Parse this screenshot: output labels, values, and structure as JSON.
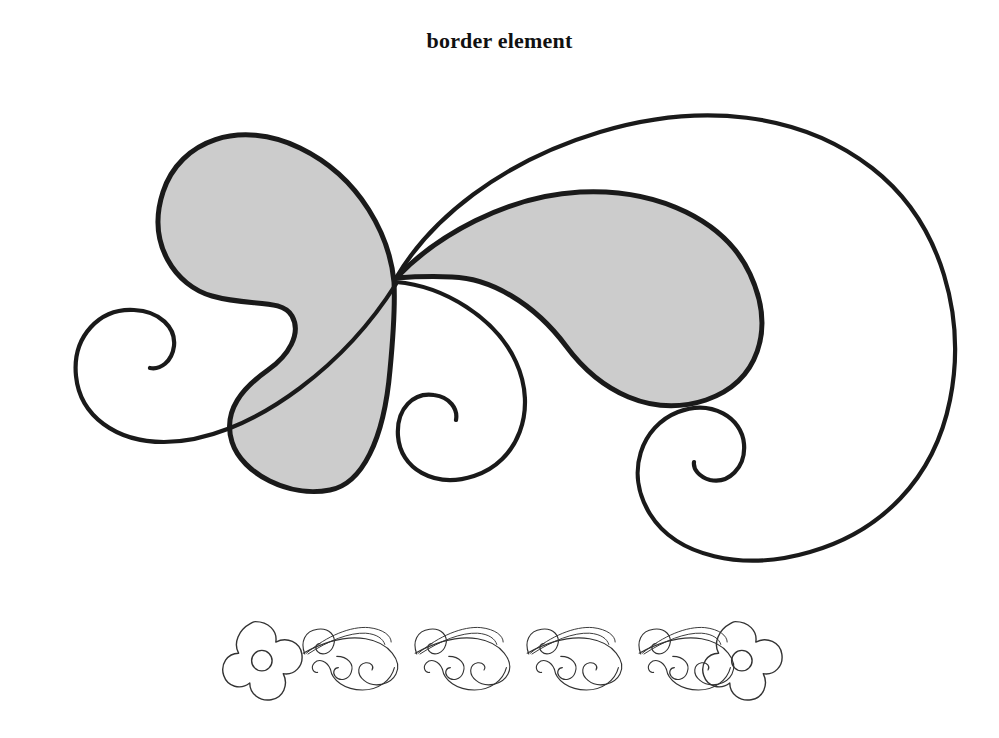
{
  "page": {
    "background_color": "#ffffff",
    "width": 999,
    "height": 738
  },
  "caption": {
    "text": "border element",
    "color": "#111111"
  },
  "artwork": {
    "title": "border element",
    "style": "paisley filigree flourish",
    "stroke_color": "#1a1a1a",
    "fill_color": "#cccccc",
    "thin_stroke_color": "#333333",
    "main_ornament": {
      "name": "paisley-flourish",
      "parts": [
        {
          "name": "left-paisley-leaf",
          "fill": "#cccccc",
          "stroke": "#1a1a1a"
        },
        {
          "name": "right-paisley-leaf",
          "fill": "#cccccc",
          "stroke": "#1a1a1a"
        },
        {
          "name": "outer-sweep-arc",
          "fill": "none",
          "stroke": "#1a1a1a"
        },
        {
          "name": "left-spiral-curl",
          "fill": "none",
          "stroke": "#1a1a1a"
        },
        {
          "name": "center-spiral-curl",
          "fill": "none",
          "stroke": "#1a1a1a"
        },
        {
          "name": "right-spiral-curl",
          "fill": "none",
          "stroke": "#1a1a1a"
        }
      ]
    },
    "border_strip": {
      "name": "floral-scroll-border",
      "flower_count": 2,
      "flower_petals": 5,
      "scroll_repeat_count": 4,
      "stroke": "#333333",
      "fill": "none"
    }
  }
}
